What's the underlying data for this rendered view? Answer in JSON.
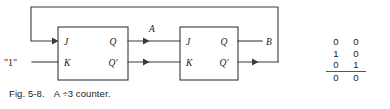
{
  "figure": {
    "caption_label": "Fig. 5-8.",
    "caption_text": "A ÷3 counter.",
    "blocks": [
      {
        "name": "flip-flop-1",
        "inputs": [
          "J",
          "K"
        ],
        "outputs": [
          "Q",
          "Q'"
        ]
      },
      {
        "name": "flip-flop-2",
        "inputs": [
          "J",
          "K"
        ],
        "outputs": [
          "Q",
          "Q'"
        ]
      }
    ],
    "signal_labels": {
      "constant_one": "\"1\"",
      "stage_a": "A",
      "stage_b": "B"
    }
  },
  "truth_table": {
    "columns": [
      "A",
      "B"
    ],
    "rows": [
      [
        "0",
        "0"
      ],
      [
        "1",
        "0"
      ],
      [
        "0",
        "1"
      ]
    ],
    "sum_row": [
      "0",
      "0"
    ]
  },
  "colors": {
    "line": "#3a3a3a",
    "text": "#1a1a1a",
    "background": "#ffffff"
  }
}
